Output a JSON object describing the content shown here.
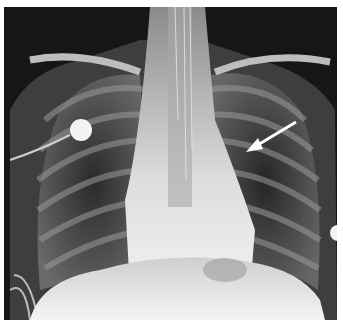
{
  "image": {
    "type": "chest-radiograph",
    "view": "frontal",
    "annotation": {
      "kind": "arrow",
      "color": "#ffffff",
      "from": [
        296,
        122
      ],
      "to": [
        246,
        152
      ]
    },
    "markers": [
      {
        "kind": "ecg-electrode",
        "center": [
          81,
          130
        ],
        "radius": 11
      },
      {
        "kind": "ecg-electrode-partial",
        "center": [
          337,
          233
        ],
        "radius": 8
      }
    ],
    "colors": {
      "background": "#141414",
      "border": "#ffffff",
      "bone": "#d8d8d8",
      "soft_tissue": "#eeeeee"
    }
  }
}
